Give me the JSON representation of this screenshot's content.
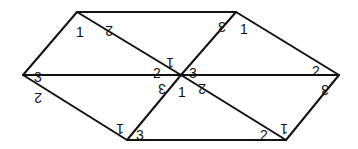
{
  "diagram": {
    "line_color": "#111111",
    "background": "#ffffff",
    "vertices": [
      {
        "id": "A",
        "name": "top-left"
      },
      {
        "id": "B",
        "name": "top-right"
      },
      {
        "id": "C",
        "name": "left"
      },
      {
        "id": "O",
        "name": "center"
      },
      {
        "id": "D",
        "name": "right"
      },
      {
        "id": "E",
        "name": "bottom-left"
      },
      {
        "id": "F",
        "name": "bottom-right"
      }
    ],
    "edges": [
      {
        "from": "A",
        "to": "B"
      },
      {
        "from": "A",
        "to": "C"
      },
      {
        "from": "A",
        "to": "O"
      },
      {
        "from": "B",
        "to": "O"
      },
      {
        "from": "B",
        "to": "D"
      },
      {
        "from": "C",
        "to": "O"
      },
      {
        "from": "O",
        "to": "D"
      },
      {
        "from": "C",
        "to": "E"
      },
      {
        "from": "O",
        "to": "E"
      },
      {
        "from": "O",
        "to": "F"
      },
      {
        "from": "E",
        "to": "F"
      },
      {
        "from": "D",
        "to": "F"
      }
    ],
    "labels": [
      {
        "text": "1",
        "vertex": "A",
        "rotated": false
      },
      {
        "text": "2",
        "vertex": "A",
        "rotated": true
      },
      {
        "text": "3",
        "vertex": "B",
        "rotated": true
      },
      {
        "text": "1",
        "vertex": "B",
        "rotated": false
      },
      {
        "text": "3",
        "vertex": "C",
        "rotated": false
      },
      {
        "text": "2",
        "vertex": "C",
        "rotated": true
      },
      {
        "text": "2",
        "vertex": "O",
        "rotated": false
      },
      {
        "text": "1",
        "vertex": "O",
        "rotated": true
      },
      {
        "text": "3",
        "vertex": "O",
        "rotated": false
      },
      {
        "text": "3",
        "vertex": "O",
        "rotated": true
      },
      {
        "text": "1",
        "vertex": "O",
        "rotated": false
      },
      {
        "text": "2",
        "vertex": "O",
        "rotated": true
      },
      {
        "text": "2",
        "vertex": "D",
        "rotated": false
      },
      {
        "text": "3",
        "vertex": "D",
        "rotated": true
      },
      {
        "text": "1",
        "vertex": "E",
        "rotated": true
      },
      {
        "text": "3",
        "vertex": "E",
        "rotated": false
      },
      {
        "text": "2",
        "vertex": "F",
        "rotated": false
      },
      {
        "text": "1",
        "vertex": "F",
        "rotated": true
      }
    ]
  }
}
